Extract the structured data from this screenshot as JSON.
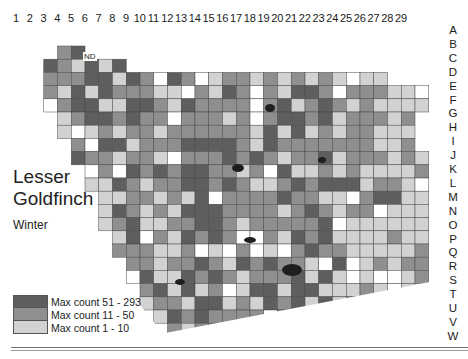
{
  "map": {
    "title_line1": "Lesser",
    "title_line2": "Goldfinch",
    "season": "Winter",
    "no_data_label": "ND",
    "columns": [
      "1",
      "2",
      "3",
      "4",
      "5",
      "6",
      "7",
      "8",
      "9",
      "10",
      "11",
      "12",
      "13",
      "14",
      "15",
      "16",
      "17",
      "18",
      "19",
      "20",
      "21",
      "22",
      "23",
      "24",
      "25",
      "26",
      "27",
      "28",
      "29"
    ],
    "rows": [
      "A",
      "B",
      "C",
      "D",
      "E",
      "F",
      "G",
      "H",
      "I",
      "J",
      "K",
      "L",
      "M",
      "N",
      "O",
      "P",
      "Q",
      "R",
      "S",
      "T",
      "U",
      "V",
      "W"
    ],
    "legend": [
      {
        "label": "Max count 51 - 293",
        "color": "#5e5e5e"
      },
      {
        "label": "Max count 11 - 50",
        "color": "#8f8f8f"
      },
      {
        "label": "Max count 1 - 10",
        "color": "#d2d2d2"
      }
    ],
    "colors": {
      "high": "#5e5e5e",
      "mid": "#8f8f8f",
      "low": "#d2d2d2",
      "none": "#ffffff",
      "grid_line": "#4a4a4a",
      "water": "#1e1e1e"
    }
  }
}
